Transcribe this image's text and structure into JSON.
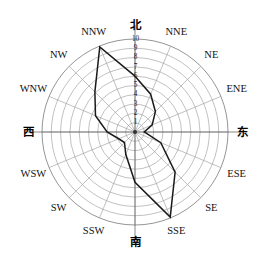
{
  "chart_data": {
    "type": "line",
    "subtype": "wind-rose-radar",
    "title": "",
    "xlabel": "",
    "ylabel": "",
    "grid": true,
    "legend": false,
    "rlim": [
      0,
      10
    ],
    "r_ticks": [
      "1",
      "2",
      "3",
      "4",
      "5",
      "6",
      "7",
      "8",
      "9",
      "10"
    ],
    "r_tick_values": [
      1,
      2,
      3,
      4,
      5,
      6,
      7,
      8,
      9,
      10
    ],
    "tick_axis_direction": "N",
    "categories": [
      "北",
      "NNE",
      "NE",
      "ENE",
      "东",
      "ESE",
      "SE",
      "SSE",
      "南",
      "SSW",
      "SW",
      "WSW",
      "西",
      "WNW",
      "NW",
      "NNW"
    ],
    "category_labels_latin": [
      "N",
      "NNE",
      "NE",
      "ENE",
      "E",
      "ESE",
      "SE",
      "SSE",
      "S",
      "SSW",
      "SW",
      "WSW",
      "W",
      "WNW",
      "NW",
      "NNW"
    ],
    "values": [
      6,
      4.4,
      3.1,
      2.0,
      1.0,
      3.0,
      6.1,
      9.9,
      5.4,
      2.6,
      1.6,
      1.9,
      3.0,
      4.6,
      6.1,
      9.9
    ],
    "series": [
      {
        "name": "风向频率",
        "values": [
          6,
          4.4,
          3.1,
          2.0,
          1.0,
          3.0,
          6.1,
          9.9,
          5.4,
          2.6,
          1.6,
          1.9,
          3.0,
          4.6,
          6.1,
          9.9
        ]
      }
    ],
    "closed": true,
    "peak_directions": [
      "NNW",
      "SSE"
    ],
    "peak_value": 9.9
  },
  "labels": {
    "north": "北",
    "nne": "NNE",
    "ne": "NE",
    "ene": "ENE",
    "east": "东",
    "ese": "ESE",
    "se": "SE",
    "sse": "SSE",
    "south": "南",
    "ssw": "SSW",
    "sw": "SW",
    "wsw": "WSW",
    "west": "西",
    "wnw": "WNW",
    "nw": "NW",
    "nnw": "NNW"
  },
  "colors": {
    "data_line": "#1a1a1a",
    "grid": "#8d8d8d",
    "background": "#ffffff",
    "text": "#111111"
  },
  "geometry": {
    "center_x": 135,
    "center_y": 132,
    "outer_radius": 93,
    "ring_count": 10
  }
}
